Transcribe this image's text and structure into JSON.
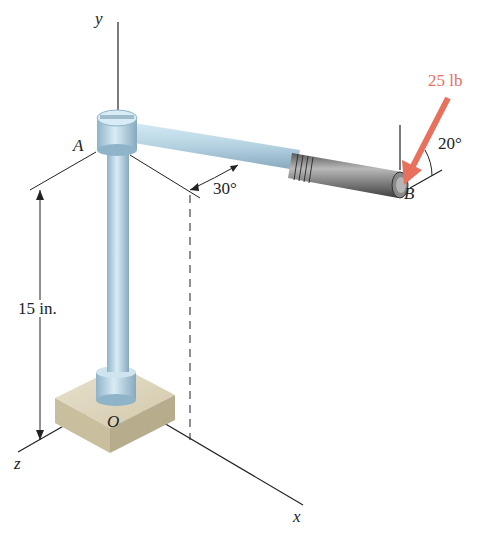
{
  "diagram": {
    "type": "3d-statics-figure",
    "axes": {
      "x": "x",
      "y": "y",
      "z": "z"
    },
    "points": {
      "A": "A",
      "B": "B",
      "O": "O"
    },
    "dimension": {
      "label": "15 in."
    },
    "angles": {
      "arm_angle": "30°",
      "force_angle": "20°"
    },
    "force": {
      "label": "25 lb",
      "color": "#e8705d"
    },
    "colors": {
      "rod": "#b9d6e6",
      "rod_shade": "#8fb3c9",
      "base": "#ddd5be",
      "grip": "#6b6b6b"
    }
  }
}
